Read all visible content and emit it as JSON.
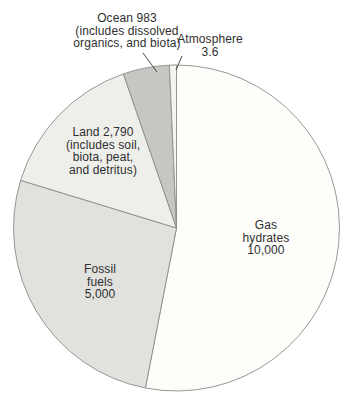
{
  "chart_data": {
    "type": "pie",
    "title": "",
    "total": 18776.6,
    "legend_position": "labels-on-chart",
    "slices": [
      {
        "id": "gas-hydrates",
        "label": "Gas hydrates",
        "value": 10000,
        "value_text": "10,000",
        "percent": 53.3,
        "color": "#fdfdfa",
        "start_angle": 0,
        "end_angle": 191
      },
      {
        "id": "fossil-fuels",
        "label": "Fossil fuels",
        "value": 5000,
        "value_text": "5,000",
        "percent": 26.6,
        "color": "#e1e1de",
        "start_angle": 191,
        "end_angle": 287
      },
      {
        "id": "land",
        "label": "Land (includes soil, biota, peat, and detritus)",
        "value": 2790,
        "value_text": "2,790",
        "percent": 14.9,
        "color": "#eeeeeb",
        "start_angle": 287,
        "end_angle": 341
      },
      {
        "id": "ocean",
        "label": "Ocean (includes dissolved organics, and biota)",
        "value": 983,
        "value_text": "983",
        "percent": 5.2,
        "color": "#c6c6c3",
        "start_angle": 341,
        "end_angle": 357.5
      },
      {
        "id": "atmosphere",
        "label": "Atmosphere",
        "value": 3.6,
        "value_text": "3.6",
        "percent": 0.02,
        "color": "#f4f4f1",
        "start_angle": 357.5,
        "end_angle": 360
      }
    ],
    "geometry": {
      "cx": 176.5,
      "cy": 228,
      "r": 163,
      "stroke": "#8c8c8c",
      "stroke_width": 0.9
    }
  },
  "labels": {
    "ocean": {
      "lines": [
        "Ocean 983",
        "(includes dissolved",
        "organics, and biota)"
      ]
    },
    "atmosphere": {
      "lines": [
        "Atmosphere",
        "3.6"
      ]
    },
    "land": {
      "lines": [
        "Land 2,790",
        "(includes soil,",
        "biota, peat,",
        "and detritus)"
      ]
    },
    "fossil_fuels": {
      "lines": [
        "Fossil",
        "fuels",
        "5,000"
      ]
    },
    "gas_hydrates": {
      "lines": [
        "Gas",
        "hydrates",
        "10,000"
      ]
    }
  }
}
